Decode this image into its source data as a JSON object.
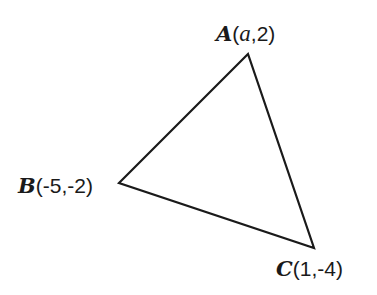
{
  "diagram": {
    "type": "triangle",
    "stroke_color": "#1a1a1a",
    "vertices": [
      {
        "name": "A",
        "coords_text_pre": "(",
        "coords_var": "a",
        "coords_text_post": ",2)",
        "x": 248,
        "y": 54
      },
      {
        "name": "B",
        "coords_text": "(-5,-2)",
        "x": 119,
        "y": 183
      },
      {
        "name": "C",
        "coords_text": "(1,-4)",
        "x": 314,
        "y": 248
      }
    ]
  }
}
